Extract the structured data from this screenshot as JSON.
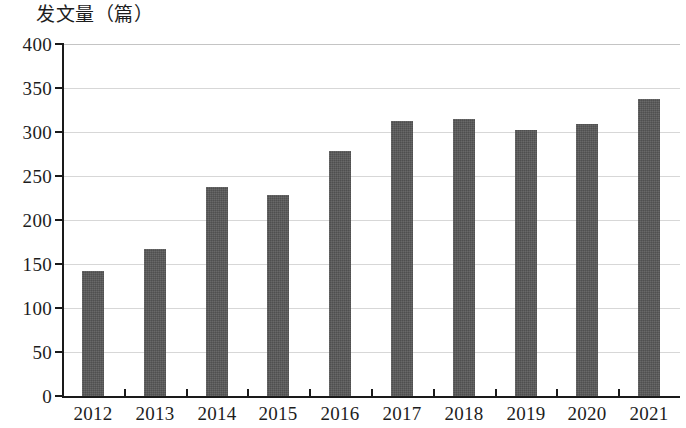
{
  "chart_data": {
    "type": "bar",
    "title": "发文量（篇）",
    "xlabel": "",
    "ylabel": "发文量（篇）",
    "categories": [
      "2012",
      "2013",
      "2014",
      "2015",
      "2016",
      "2017",
      "2018",
      "2019",
      "2020",
      "2021"
    ],
    "values": [
      142,
      167,
      237,
      228,
      278,
      312,
      315,
      302,
      309,
      338
    ],
    "ylim": [
      0,
      400
    ],
    "ytick_labels": [
      "400",
      "350",
      "300",
      "250",
      "200",
      "150",
      "100",
      "50",
      "0"
    ],
    "ytick_values": [
      400,
      350,
      300,
      250,
      200,
      150,
      100,
      50,
      0
    ],
    "grid": true,
    "grid_axis": "y",
    "legend": null,
    "series": [
      {
        "name": "发文量",
        "color": "#575757",
        "values": [
          142,
          167,
          237,
          228,
          278,
          312,
          315,
          302,
          309,
          338
        ]
      }
    ],
    "colors": {
      "bar": "#575757",
      "axis": "#1a1a1a",
      "grid": "#d7d7d7",
      "text": "#1d1d1d",
      "background": "#ffffff"
    }
  }
}
